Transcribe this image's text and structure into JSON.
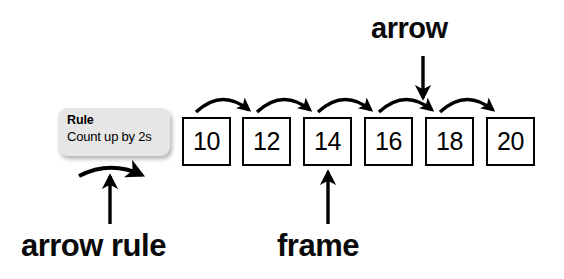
{
  "diagram": {
    "rule_card": {
      "title": "Rule",
      "body": "Count up by 2s"
    },
    "frames": [
      {
        "value": "10"
      },
      {
        "value": "12"
      },
      {
        "value": "14"
      },
      {
        "value": "16"
      },
      {
        "value": "18"
      },
      {
        "value": "20"
      }
    ],
    "callouts": {
      "arrow": "arrow",
      "arrow_rule": "arrow rule",
      "frame": "frame"
    },
    "colors": {
      "ink": "#000000",
      "card_fill": "#e6e6e6",
      "page_background": "#ffffff"
    }
  }
}
